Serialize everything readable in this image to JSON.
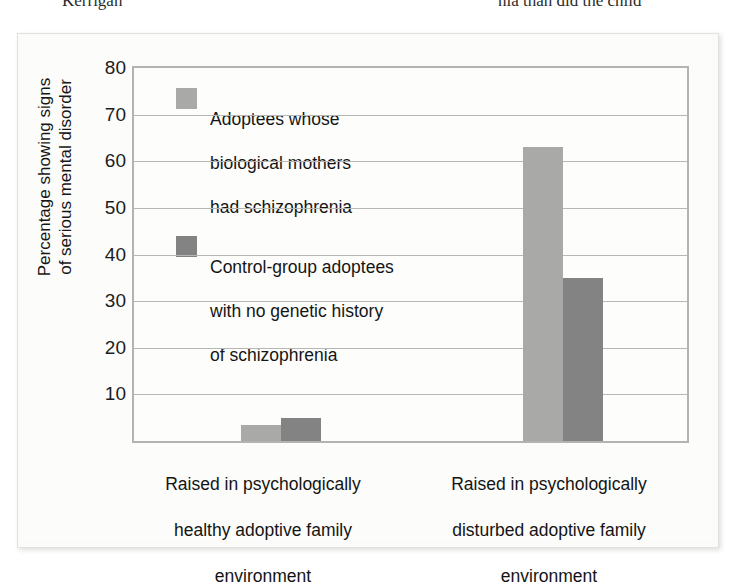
{
  "page_text": {
    "left_fragment": "Kerrigan",
    "right_fragment": "nia than did the child"
  },
  "chart_data": {
    "type": "bar",
    "title": "",
    "xlabel": "",
    "ylabel": "Percentage showing signs\nof serious mental disorder",
    "ylabel_lines": [
      "Percentage showing signs",
      "of serious mental disorder"
    ],
    "ylim": [
      0,
      80
    ],
    "yticks": [
      80,
      70,
      60,
      50,
      40,
      30,
      20,
      10
    ],
    "grid": true,
    "legend_position": "inside-top-left",
    "categories": [
      "Raised in psychologically\nhealthy adoptive family\nenvironment",
      "Raised in psychologically\ndisturbed adoptive family\nenvironment"
    ],
    "category_lines": [
      [
        "Raised in psychologically",
        "healthy adoptive family",
        "environment"
      ],
      [
        "Raised in psychologically",
        "disturbed adoptive family",
        "environment"
      ]
    ],
    "series": [
      {
        "name": "Adoptees whose\nbiological mothers\nhad schizophrenia",
        "name_lines": [
          "Adoptees whose",
          "biological mothers",
          "had schizophrenia"
        ],
        "color": "#a9a9a7",
        "values": [
          3.5,
          63
        ]
      },
      {
        "name": "Control-group adoptees\nwith no genetic history\nof schizophrenia",
        "name_lines": [
          "Control-group adoptees",
          "with no genetic history",
          "of schizophrenia"
        ],
        "color": "#838383",
        "values": [
          5,
          35
        ]
      }
    ]
  },
  "colors": {
    "series_light": "#a9a9a7",
    "series_dark": "#838383",
    "gridline": "#b6b6b4",
    "plot_border": "#b3b3b1",
    "card_background": "#fbfbfa",
    "text": "#151515"
  }
}
